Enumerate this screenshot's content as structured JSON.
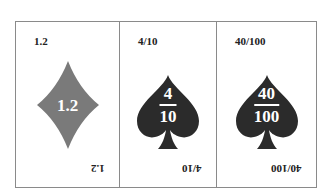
{
  "colors": {
    "diamond": "#7a7a7a",
    "spade": "#2b2b2b",
    "border": "#8a8a8a"
  },
  "cards": [
    {
      "suit": "diamond-icon",
      "corner": "1.2",
      "center": "1.2"
    },
    {
      "suit": "spade-icon",
      "corner": "4/10",
      "numerator": "4",
      "denominator": "10"
    },
    {
      "suit": "spade-icon",
      "corner": "40/100",
      "numerator": "40",
      "denominator": "100"
    }
  ]
}
